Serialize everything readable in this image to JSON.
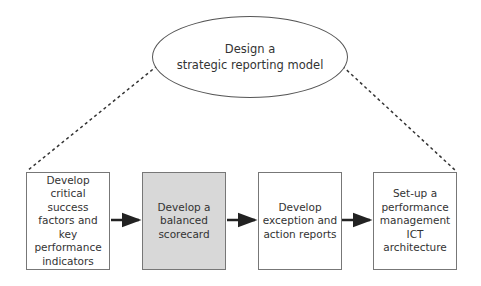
{
  "top_node": {
    "line1": "Design a",
    "line2": "strategic reporting model"
  },
  "steps": [
    {
      "label": "Develop critical success factors and key performance indicators",
      "highlighted": false
    },
    {
      "label": "Develop a balanced scorecard",
      "highlighted": true
    },
    {
      "label": "Develop exception and action reports",
      "highlighted": false
    },
    {
      "label": "Set-up a performance management ICT architecture",
      "highlighted": false
    }
  ],
  "colors": {
    "highlight_fill": "#d8d8d8",
    "border": "#777777",
    "arrow": "#222222"
  }
}
